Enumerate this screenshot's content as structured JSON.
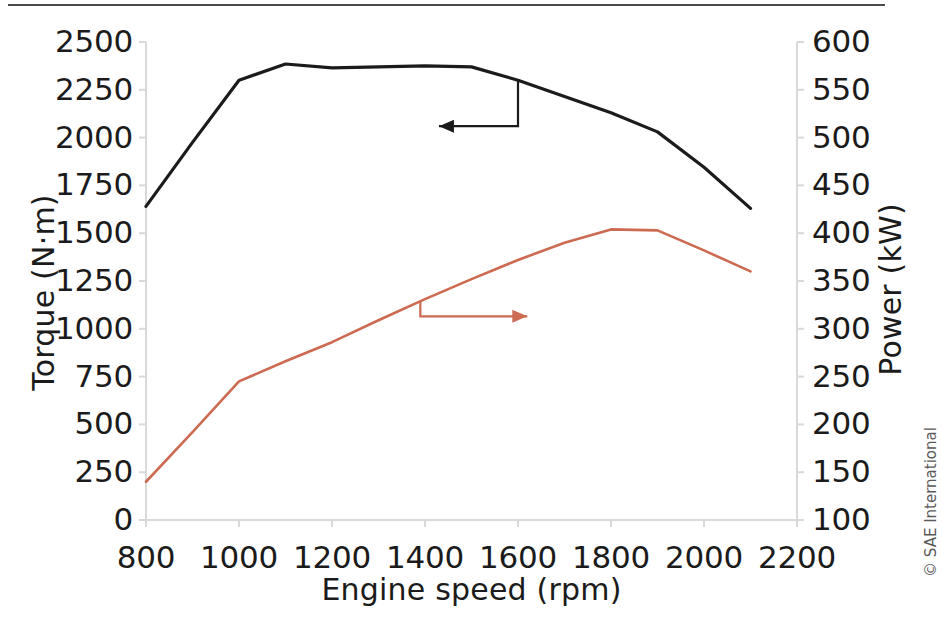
{
  "figure": {
    "credit": "© SAE International"
  },
  "chart_data": {
    "type": "line",
    "title": "",
    "xlabel": "Engine speed (rpm)",
    "ylabel": "Torque (N·m)",
    "ylabel_secondary": "Power (kW)",
    "xlim": [
      800,
      2200
    ],
    "ylim": [
      0,
      2500
    ],
    "ylim_secondary": [
      100,
      600
    ],
    "grid": false,
    "legend": "none",
    "xticks": [
      800,
      1000,
      1200,
      1400,
      1600,
      1800,
      2000,
      2200
    ],
    "xtick_labels": [
      "800",
      "1000",
      "1200",
      "1400",
      "1600",
      "1800",
      "2000",
      "2200"
    ],
    "yticks": [
      0,
      250,
      500,
      750,
      1000,
      1250,
      1500,
      1750,
      2000,
      2250,
      2500
    ],
    "ytick_labels": [
      "0",
      "250",
      "500",
      "750",
      "1000",
      "1250",
      "1500",
      "1750",
      "2000",
      "2250",
      "2500"
    ],
    "yticks_secondary": [
      100,
      150,
      200,
      250,
      300,
      350,
      400,
      450,
      500,
      550,
      600
    ],
    "ytick_labels_secondary": [
      "100",
      "150",
      "200",
      "250",
      "300",
      "350",
      "400",
      "450",
      "500",
      "550",
      "600"
    ],
    "series": [
      {
        "name": "Torque",
        "axis": "left",
        "color": "#1b1b1b",
        "unit": "N·m",
        "x": [
          800,
          900,
          1000,
          1100,
          1200,
          1300,
          1400,
          1500,
          1600,
          1700,
          1800,
          1900,
          2000,
          2100
        ],
        "values": [
          1640,
          1975,
          2300,
          2385,
          2365,
          2370,
          2375,
          2370,
          2300,
          2215,
          2130,
          2030,
          1845,
          1630
        ]
      },
      {
        "name": "Power",
        "axis": "right",
        "color": "#cc6a52",
        "unit": "kW",
        "x": [
          800,
          900,
          1000,
          1100,
          1200,
          1300,
          1400,
          1500,
          1600,
          1700,
          1800,
          1900,
          2000,
          2100
        ],
        "values": [
          140,
          192,
          245,
          266,
          286,
          309,
          331,
          352,
          372,
          390,
          404,
          403,
          382,
          360
        ]
      }
    ],
    "annotations": [
      {
        "name": "torque-pointer-arrow",
        "color": "#1b1b1b",
        "direction": "left",
        "anchor_series": "Torque",
        "anchor_x": 1600,
        "drop_to_y_left": 2060,
        "tip_x": 1430
      },
      {
        "name": "power-pointer-arrow",
        "color": "#cc6a52",
        "direction": "right",
        "anchor_series": "Power",
        "anchor_x": 1390,
        "drop_to_y_right": 313,
        "tip_x": 1620
      }
    ]
  }
}
